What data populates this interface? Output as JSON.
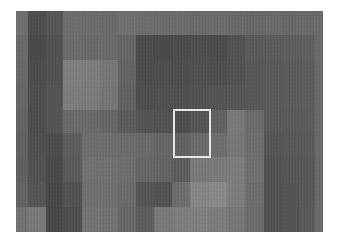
{
  "image": {
    "description": "Grayscale pixelated mosaic with a highlighted region box",
    "frame": {
      "x": 16,
      "y": 11,
      "width": 307,
      "height": 221
    },
    "grid": {
      "col_widths": [
        12,
        18,
        17,
        19,
        18,
        18,
        18,
        18,
        18,
        18,
        19,
        18,
        18,
        19,
        18,
        18,
        15
      ],
      "row_heights": [
        24,
        25,
        25,
        25,
        23,
        24,
        25,
        25,
        25
      ],
      "cells": [
        [
          "#707070",
          "#4e4e4e",
          "#565656",
          "#6e6e6e",
          "#6c6c6c",
          "#6a6a6a",
          "#707070",
          "#6e6e6e",
          "#6c6c6c",
          "#6c6c6c",
          "#6a6a6a",
          "#6c6c6c",
          "#6a6a6a",
          "#686868",
          "#6a6a6a",
          "#686868",
          "#6a6a6a"
        ],
        [
          "#6a6a6a",
          "#4a4a4a",
          "#525252",
          "#6c6c6c",
          "#6a6a6a",
          "#6a6a6a",
          "#666666",
          "#4c4c4c",
          "#4a4a4a",
          "#4c4c4c",
          "#4e4e4e",
          "#4c4c4c",
          "#525252",
          "#5a5a5a",
          "#5c5c5c",
          "#5e5e5e",
          "#606060"
        ],
        [
          "#686868",
          "#4c4c4c",
          "#525252",
          "#808080",
          "#7e7e7e",
          "#787878",
          "#646464",
          "#4c4c4c",
          "#4e4e4e",
          "#4e4e4e",
          "#505050",
          "#4e4e4e",
          "#525252",
          "#585858",
          "#5a5a5a",
          "#5c5c5c",
          "#5e5e5e"
        ],
        [
          "#666666",
          "#4e4e4e",
          "#545454",
          "#7e7e7e",
          "#7c7c7c",
          "#767676",
          "#626262",
          "#4e4e4e",
          "#505050",
          "#505050",
          "#525252",
          "#545454",
          "#565656",
          "#585858",
          "#5a5a5a",
          "#5c5c5c",
          "#5e5e5e"
        ],
        [
          "#646464",
          "#4e4e4e",
          "#545454",
          "#6a6a6a",
          "#6a6a6a",
          "#666666",
          "#5c5c5c",
          "#545454",
          "#525252",
          "#4e4e4e",
          "#555555",
          "#626262",
          "#7a7a7a",
          "#6c6c6c",
          "#5a5a5a",
          "#5a5a5a",
          "#5c5c5c"
        ],
        [
          "#626262",
          "#505050",
          "#4c4c4c",
          "#5e5e5e",
          "#6e6e6e",
          "#6e6e6e",
          "#6c6c6c",
          "#6a6a6a",
          "#666666",
          "#626262",
          "#6a6a6a",
          "#6e6e6e",
          "#787878",
          "#6e6e6e",
          "#555555",
          "#585858",
          "#5a5a5a"
        ],
        [
          "#606060",
          "#525252",
          "#4a4a4a",
          "#5a5a5a",
          "#727272",
          "#727272",
          "#6e6e6e",
          "#666666",
          "#646464",
          "#5e5e5e",
          "#7a7a7a",
          "#7c7c7c",
          "#7e7e7e",
          "#707070",
          "#525252",
          "#565656",
          "#585858"
        ],
        [
          "#646464",
          "#565656",
          "#484848",
          "#525252",
          "#707070",
          "#707070",
          "#6a6a6a",
          "#565656",
          "#525252",
          "#6e6e6e",
          "#868686",
          "#8a8a8a",
          "#7e7e7e",
          "#6e6e6e",
          "#525252",
          "#545454",
          "#585858"
        ],
        [
          "#727272",
          "#7a7a7a",
          "#464646",
          "#4e4e4e",
          "#747474",
          "#727272",
          "#686868",
          "#5e5e5e",
          "#7a7a7a",
          "#7e7e7e",
          "#808080",
          "#7e7e7e",
          "#787878",
          "#6c6c6c",
          "#525252",
          "#545454",
          "#5a5a5a"
        ]
      ]
    },
    "highlight_box": {
      "label": "selected-region",
      "x": 173,
      "y": 109,
      "width": 38,
      "height": 49,
      "color": "#e8e8e8"
    }
  }
}
